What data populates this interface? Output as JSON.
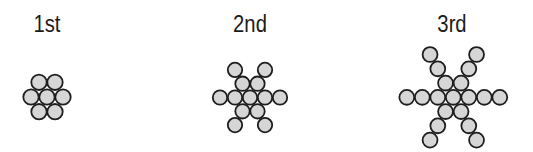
{
  "style": {
    "circle_fill": "#d6d6d6",
    "circle_stroke": "#1e1e1e",
    "circle_stroke_width": 1.8
  },
  "stages": [
    {
      "label": "1st",
      "label_x": 47,
      "center": [
        47,
        97
      ],
      "spacing": 16,
      "radius": 8,
      "cells": [
        [
          0,
          0
        ],
        [
          1,
          0
        ],
        [
          -1,
          0
        ],
        [
          0,
          -1
        ],
        [
          1,
          -1
        ],
        [
          0,
          1
        ],
        [
          -1,
          1
        ]
      ]
    },
    {
      "label": "2nd",
      "label_x": 250,
      "center": [
        250,
        97.5
      ],
      "spacing": 15,
      "radius": 7.5,
      "cells": [
        [
          0,
          0
        ],
        [
          1,
          0
        ],
        [
          -1,
          0
        ],
        [
          2,
          0
        ],
        [
          -2,
          0
        ],
        [
          0,
          -1
        ],
        [
          1,
          -1
        ],
        [
          0,
          1
        ],
        [
          -1,
          1
        ],
        [
          0,
          -2
        ],
        [
          2,
          -2
        ],
        [
          -2,
          2
        ],
        [
          0,
          2
        ]
      ]
    },
    {
      "label": "3rd",
      "label_x": 452,
      "center": [
        453.3,
        97.3
      ],
      "spacing": 15.5,
      "radius": 7.75,
      "cells": [
        [
          0,
          0
        ],
        [
          1,
          0
        ],
        [
          -1,
          0
        ],
        [
          2,
          0
        ],
        [
          -2,
          0
        ],
        [
          3,
          0
        ],
        [
          -3,
          0
        ],
        [
          0,
          -1
        ],
        [
          1,
          -1
        ],
        [
          0,
          1
        ],
        [
          -1,
          1
        ],
        [
          0,
          -2
        ],
        [
          2,
          -2
        ],
        [
          -2,
          2
        ],
        [
          0,
          2
        ],
        [
          0,
          -3
        ],
        [
          3,
          -3
        ],
        [
          -3,
          3
        ],
        [
          0,
          3
        ]
      ]
    }
  ]
}
